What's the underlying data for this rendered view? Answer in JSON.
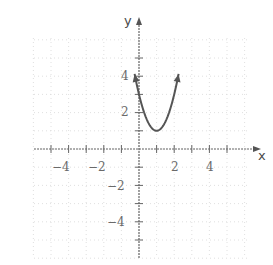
{
  "chart_data": {
    "type": "line",
    "title": "",
    "xlabel": "x",
    "ylabel": "y",
    "xlim": [
      -6,
      6.8
    ],
    "ylim": [
      -6,
      6
    ],
    "grid": true,
    "x_tick_labels": [
      "-4",
      "-2",
      "2",
      "4"
    ],
    "y_tick_labels": [
      "4",
      "2",
      "-2",
      "-4"
    ],
    "series": [
      {
        "name": "y = 2(x-1)^2 + 1",
        "function": "2*(x-1)^2+1",
        "vertex": [
          1,
          1
        ],
        "x": [
          -0.2,
          0,
          0.5,
          1,
          1.5,
          2,
          2.2
        ],
        "y": [
          3.88,
          3,
          1.5,
          1,
          1.5,
          3,
          3.88
        ],
        "domain": [
          -0.25,
          2.25
        ],
        "arrows_both_ends": true
      }
    ]
  },
  "labels": {
    "x_axis": "x",
    "y_axis": "y",
    "x_neg4": "−4",
    "x_neg2": "−2",
    "x_pos2": "2",
    "x_pos4": "4",
    "y_pos4": "4",
    "y_pos2": "2",
    "y_neg2": "−2",
    "y_neg4": "−4"
  },
  "colors": {
    "curve": "#555555",
    "axis": "#666666",
    "grid": "#d8d8d8"
  }
}
